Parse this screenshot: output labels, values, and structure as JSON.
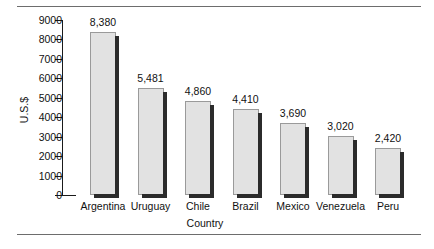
{
  "chart_data": {
    "type": "bar",
    "title": "",
    "xlabel": "Country",
    "ylabel": "U.S.$",
    "ylim": [
      0,
      9000
    ],
    "grid": false,
    "legend": "none",
    "categories": [
      "Argentina",
      "Uruguay",
      "Chile",
      "Brazil",
      "Mexico",
      "Venezuela",
      "Peru"
    ],
    "values": [
      8380,
      5481,
      4860,
      4410,
      3690,
      3020,
      2420
    ],
    "value_labels": [
      "8,380",
      "5,481",
      "4,860",
      "4,410",
      "3,690",
      "3,020",
      "2,420"
    ],
    "ytick_labels": [
      "9000",
      "8000",
      "7000",
      "6000",
      "5000",
      "4000",
      "3000",
      "2000",
      "1000",
      "0"
    ],
    "yticks": [
      9000,
      8000,
      7000,
      6000,
      5000,
      4000,
      3000,
      2000,
      1000,
      0
    ],
    "bar_color": "#e2e2e2",
    "bar_shadow_color": "#2b2b2b",
    "axis_color": "#1a1a1a",
    "rule_color": "#6d6d6d"
  }
}
